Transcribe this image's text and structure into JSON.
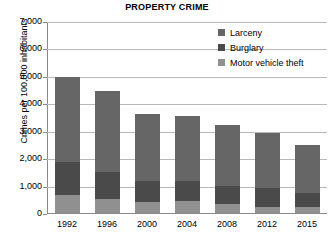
{
  "chart_data": {
    "type": "bar",
    "subtype": "stacked-vertical",
    "title": "PROPERTY CRIME",
    "xlabel": "",
    "ylabel": "Crimes per 100,000 inhabitants",
    "categories": [
      "1992",
      "1996",
      "2000",
      "2004",
      "2008",
      "2012",
      "2015"
    ],
    "ylim": [
      0,
      7000
    ],
    "ytick_values": [
      0,
      1000,
      2000,
      3000,
      4000,
      5000,
      6000,
      7000
    ],
    "ytick_labels": [
      "0",
      "1,000",
      "2,000",
      "3,000",
      "4,000",
      "5,000",
      "6,000",
      "7,000"
    ],
    "grid": true,
    "legend_position": "top-right",
    "series": [
      {
        "name": "Larceny",
        "color": "#666666",
        "values": [
          3090,
          2970,
          2460,
          2360,
          2220,
          2020,
          1760
        ]
      },
      {
        "name": "Burglary",
        "color": "#4a4a4a",
        "values": [
          1220,
          955,
          745,
          740,
          685,
          670,
          500
        ]
      },
      {
        "name": "Motor vehicle theft",
        "color": "#909090",
        "values": [
          640,
          525,
          415,
          420,
          315,
          230,
          220
        ]
      }
    ],
    "totals": [
      4950,
      4450,
      3620,
      3520,
      3220,
      2920,
      2480
    ]
  }
}
